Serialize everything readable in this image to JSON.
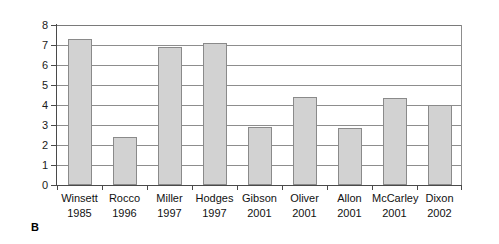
{
  "panel": {
    "letter": "B"
  },
  "chart_data": {
    "type": "bar",
    "title": "",
    "subtitle": "",
    "xlabel": "",
    "ylabel": "",
    "ylim": [
      0,
      8
    ],
    "ytick_step": 1,
    "yticks": [
      "0",
      "1",
      "2",
      "3",
      "4",
      "5",
      "6",
      "7",
      "8"
    ],
    "grid": true,
    "grid_axis": "y",
    "legend": false,
    "legend_position": "none",
    "bar_fill_color": "#d2d2d2",
    "bar_border_color": "#8a8a8a",
    "gridline_color": "#8d8d8d",
    "axis_color": "#4a4a4a",
    "categories": [
      "Winsett 1985",
      "Rocco 1996",
      "Miller 1997",
      "Hodges 1997",
      "Gibson 2001",
      "Oliver 2001",
      "Allon 2001",
      "McCarley 2001",
      "Dixon 2002"
    ],
    "category_names": [
      "Winsett",
      "Rocco",
      "Miller",
      "Hodges",
      "Gibson",
      "Oliver",
      "Allon",
      "McCarley",
      "Dixon"
    ],
    "category_years": [
      "1985",
      "1996",
      "1997",
      "1997",
      "2001",
      "2001",
      "2001",
      "2001",
      "2002"
    ],
    "values": [
      7.3,
      2.4,
      6.9,
      7.1,
      2.9,
      4.4,
      2.85,
      4.35,
      4.0
    ]
  }
}
